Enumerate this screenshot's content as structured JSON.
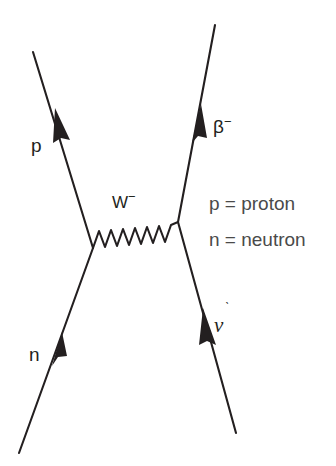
{
  "diagram": {
    "type": "feynman-diagram",
    "background_color": "#ffffff",
    "line_color": "#231f20",
    "text_color": "#231f20",
    "legend_text_color": "#4a4a4a"
  },
  "labels": {
    "proton": "p",
    "neutron": "n",
    "w_boson": "W",
    "w_boson_charge": "−",
    "beta": "β",
    "beta_charge": "−",
    "neutrino": "ν",
    "neutrino_tick": "ˋ"
  },
  "legend": {
    "items": [
      {
        "symbol": "p",
        "equals": "=",
        "name": "proton",
        "text": "p = proton"
      },
      {
        "symbol": "n",
        "equals": "=",
        "name": "neutron",
        "text": "n = neutron"
      }
    ]
  },
  "lines": [
    {
      "name": "proton-line",
      "particle": "p",
      "from": {
        "x": 93,
        "y": 248
      },
      "to": {
        "x": 33,
        "y": 52
      },
      "arrow_at": {
        "x": 61,
        "y": 124
      },
      "direction": "up-left"
    },
    {
      "name": "neutron-line",
      "particle": "n",
      "from": {
        "x": 19,
        "y": 453
      },
      "to": {
        "x": 93,
        "y": 248
      },
      "arrow_at": {
        "x": 56,
        "y": 350
      },
      "direction": "up-right"
    },
    {
      "name": "beta-line",
      "particle": "β−",
      "from": {
        "x": 178,
        "y": 222
      },
      "to": {
        "x": 215,
        "y": 25
      },
      "arrow_at": {
        "x": 197,
        "y": 126
      },
      "direction": "up-right"
    },
    {
      "name": "neutrino-line",
      "particle": "ν",
      "from": {
        "x": 236,
        "y": 433
      },
      "to": {
        "x": 178,
        "y": 222
      },
      "arrow_at": {
        "x": 209,
        "y": 330
      },
      "direction": "up-left"
    }
  ],
  "propagator": {
    "name": "w-boson-propagator",
    "particle": "W−",
    "style": "wavy",
    "from": {
      "x": 93,
      "y": 248
    },
    "to": {
      "x": 178,
      "y": 222
    },
    "oscillations": 7,
    "amplitude": 9
  },
  "vertices": [
    {
      "name": "left-vertex",
      "x": 93,
      "y": 248
    },
    {
      "name": "right-vertex",
      "x": 178,
      "y": 222
    }
  ]
}
